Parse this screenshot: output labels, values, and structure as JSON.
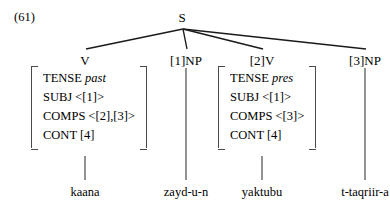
{
  "figure": {
    "example_number": "(61)",
    "root": {
      "label": "S"
    }
  },
  "nodes": [
    {
      "id": "v",
      "label": "V"
    },
    {
      "id": "np1",
      "label": "[1]NP"
    },
    {
      "id": "v2",
      "label": "[2]V"
    },
    {
      "id": "np3",
      "label": "[3]NP"
    }
  ],
  "terminals": [
    {
      "id": "kaana",
      "text": "kaana"
    },
    {
      "id": "zayd",
      "text": "zayd-u-n"
    },
    {
      "id": "yaktubu",
      "text": "yaktubu"
    },
    {
      "id": "taqriir",
      "text": "t-taqriir-a"
    }
  ],
  "avms": [
    {
      "id": "left",
      "attached_to": "V",
      "rows": [
        {
          "attribute": "TENSE",
          "value": "past",
          "italic": true
        },
        {
          "attribute": "SUBJ",
          "value": "<[1]>",
          "italic": false
        },
        {
          "attribute": "COMPS",
          "value": "<[2],[3]>",
          "italic": false
        },
        {
          "attribute": "CONT",
          "value": "[4]",
          "italic": false
        }
      ]
    },
    {
      "id": "right",
      "attached_to": "[2]V",
      "rows": [
        {
          "attribute": "TENSE",
          "value": "pres",
          "italic": true
        },
        {
          "attribute": "SUBJ",
          "value": "<[1]>",
          "italic": false
        },
        {
          "attribute": "COMPS",
          "value": "<[3]>",
          "italic": false
        },
        {
          "attribute": "CONT",
          "value": "[4]",
          "italic": false
        }
      ]
    }
  ],
  "style": {
    "line_color": "#1a1a1a",
    "stem_color": "#4a4a4a",
    "bracket_color": "#4a4a4a",
    "text_color": "#000000",
    "background": "#ffffff"
  }
}
